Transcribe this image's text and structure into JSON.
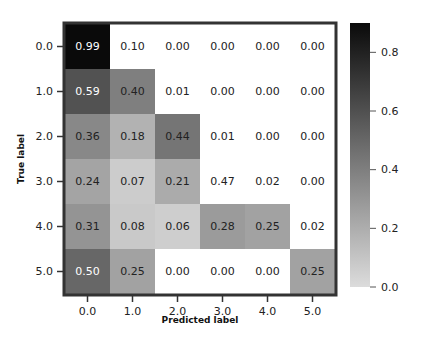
{
  "chart_data": {
    "type": "heatmap",
    "title": "",
    "xlabel": "Predicted label",
    "ylabel": "True label",
    "x_tick_labels": [
      "0.0",
      "1.0",
      "2.0",
      "3.0",
      "4.0",
      "5.0"
    ],
    "y_tick_labels": [
      "0.0",
      "1.0",
      "2.0",
      "3.0",
      "4.0",
      "5.0"
    ],
    "values": [
      [
        0.99,
        0.1,
        0.0,
        0.0,
        0.0,
        0.0
      ],
      [
        0.59,
        0.4,
        0.01,
        0.0,
        0.0,
        0.0
      ],
      [
        0.36,
        0.18,
        0.44,
        0.01,
        0.0,
        0.0
      ],
      [
        0.24,
        0.07,
        0.21,
        0.47,
        0.02,
        0.0
      ],
      [
        0.31,
        0.08,
        0.06,
        0.28,
        0.25,
        0.02
      ],
      [
        0.5,
        0.25,
        0.0,
        0.0,
        0.0,
        0.25
      ]
    ],
    "cell_labels": [
      [
        "0.99",
        "0.10",
        "0.00",
        "0.00",
        "0.00",
        "0.00"
      ],
      [
        "0.59",
        "0.40",
        "0.01",
        "0.00",
        "0.00",
        "0.00"
      ],
      [
        "0.36",
        "0.18",
        "0.44",
        "0.01",
        "0.00",
        "0.00"
      ],
      [
        "0.24",
        "0.07",
        "0.21",
        "0.47",
        "0.02",
        "0.00"
      ],
      [
        "0.31",
        "0.08",
        "0.06",
        "0.28",
        "0.25",
        "0.02"
      ],
      [
        "0.50",
        "0.25",
        "0.00",
        "0.00",
        "0.00",
        "0.25"
      ]
    ],
    "rendered_cell_shade": [
      [
        0.99,
        0.0,
        0.0,
        0.0,
        0.0,
        0.0
      ],
      [
        0.59,
        0.4,
        0.0,
        0.0,
        0.0,
        0.0
      ],
      [
        0.36,
        0.18,
        0.44,
        0.0,
        0.0,
        0.0
      ],
      [
        0.24,
        0.07,
        0.21,
        0.0,
        0.0,
        0.0
      ],
      [
        0.31,
        0.08,
        0.06,
        0.28,
        0.25,
        0.0
      ],
      [
        0.5,
        0.25,
        0.0,
        0.0,
        0.0,
        0.25
      ]
    ],
    "colorbar": {
      "ticks": [
        "0.0",
        "0.2",
        "0.4",
        "0.6",
        "0.8"
      ],
      "range": [
        0.0,
        0.9
      ],
      "colormap": "greys"
    },
    "legend": "colorbar right",
    "grid": false
  }
}
